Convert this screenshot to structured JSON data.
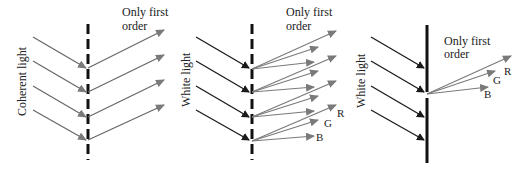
{
  "panels": [
    {
      "id": "coherent",
      "side_label": "Coherent light",
      "top_label_line1": "Only first",
      "top_label_line2": "order",
      "grating": "dashed"
    },
    {
      "id": "white-dashed",
      "side_label": "White light",
      "top_label_line1": "Only first",
      "top_label_line2": "order",
      "grating": "dashed",
      "color_labels": [
        "R",
        "G",
        "B"
      ]
    },
    {
      "id": "white-solid",
      "side_label": "White light",
      "top_label_line1": "Only first",
      "top_label_line2": "order",
      "grating": "solid",
      "color_labels": [
        "R",
        "G",
        "B"
      ]
    }
  ],
  "colors": {
    "incident": "#2a2a2a",
    "diffracted": "#7a7a7a",
    "grating": "#111111"
  }
}
